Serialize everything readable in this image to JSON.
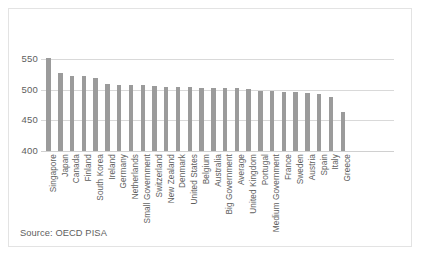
{
  "chart_data": {
    "type": "bar",
    "title": "",
    "xlabel": "",
    "ylabel": "",
    "ylim": [
      400,
      560
    ],
    "yticks": [
      400,
      450,
      500,
      550
    ],
    "grid": true,
    "legend": false,
    "bar_color": "#9b9b9b",
    "gridline_color": "#d9d9d9",
    "categories": [
      "Singapore",
      "Japan",
      "Canada",
      "Finland",
      "South Korea",
      "Ireland",
      "Germany",
      "Netherlands",
      "Small Government",
      "Switzerland",
      "New Zealand",
      "Denmark",
      "United States",
      "Belgium",
      "Australia",
      "Big Government",
      "Average",
      "United Kingdom",
      "Portugal",
      "Medium Government",
      "France",
      "Sweden",
      "Austria",
      "Spain",
      "Italy",
      "Greece"
    ],
    "values": [
      551,
      528,
      523,
      523,
      519,
      509,
      508,
      508,
      508,
      506,
      505,
      504,
      504,
      503,
      503,
      503,
      503,
      501,
      498,
      498,
      497,
      497,
      494,
      493,
      488,
      463
    ]
  },
  "annotations": {
    "source": "Source: OECD PISA"
  }
}
